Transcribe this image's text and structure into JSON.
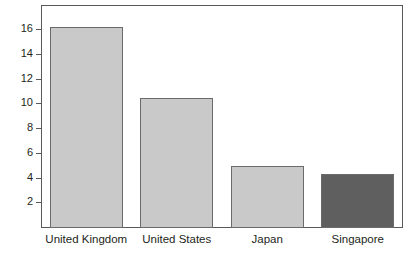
{
  "chart_data": {
    "type": "bar",
    "title": "",
    "subtitle": "",
    "xlabel": "",
    "ylabel": "",
    "categories": [
      "United Kingdom",
      "United States",
      "Japan",
      "Singapore"
    ],
    "values": [
      16.3,
      10.5,
      5.0,
      4.35
    ],
    "series": [
      {
        "name": "",
        "values": [
          16.3,
          10.5,
          5.0,
          4.35
        ]
      }
    ],
    "ylim": [
      0,
      18.05
    ],
    "xlim": [
      0,
      4
    ],
    "y_ticks": [
      2,
      4,
      6,
      8,
      10,
      12,
      14,
      16
    ],
    "y_tick_labels": [
      "2",
      "4",
      "6",
      "8",
      "10",
      "12",
      "14",
      "16"
    ],
    "grid": false,
    "legend": null,
    "legend_position": "none",
    "annotations": [],
    "bar_colors": [
      "#c9c9c9",
      "#c9c9c9",
      "#c9c9c9",
      "#5f5f5f"
    ],
    "bar_border_color": "#6b6b6b",
    "axis_color": "#595959",
    "text_color": "#231f20",
    "background_color": "#ffffff"
  },
  "colors": {
    "light_bar": "#c9c9c9",
    "dark_bar": "#5f5f5f",
    "axis": "#595959",
    "text": "#231f20",
    "background": "#ffffff"
  }
}
